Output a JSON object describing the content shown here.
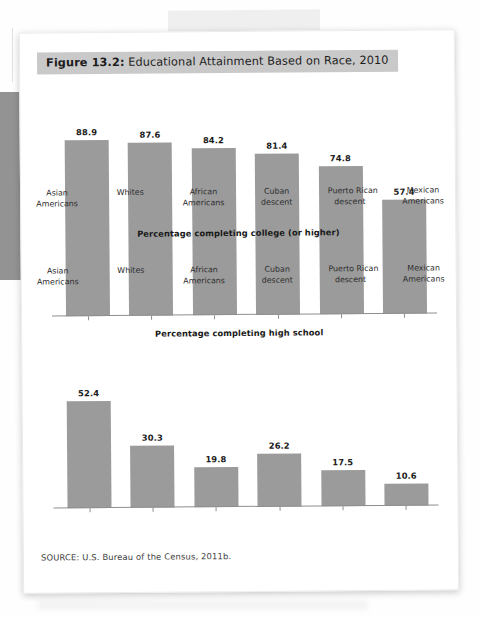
{
  "figure": {
    "number_label": "Figure 13.2:",
    "title_text": " Educational Attainment Based on Race, 2010",
    "source": "SOURCE: U.S. Bureau of the Census, 2011b.",
    "title_highlight_color": "#c9c9c9",
    "bar_color": "#9b9b9b"
  },
  "chart_data": [
    {
      "type": "bar",
      "title": "Percentage completing high school",
      "xlabel": "",
      "ylabel": "",
      "ylim": [
        0,
        100
      ],
      "grid": false,
      "legend": "none",
      "categories": [
        "Asian Americans",
        "Whites",
        "African Americans",
        "Cuban descent",
        "Puerto Rican descent",
        "Mexican Americans"
      ],
      "category_lines": [
        [
          "Asian",
          "Americans"
        ],
        [
          "Whites",
          ""
        ],
        [
          "African",
          "Americans"
        ],
        [
          "Cuban",
          "descent"
        ],
        [
          "Puerto Rican",
          "descent"
        ],
        [
          "Mexican",
          "Americans"
        ]
      ],
      "values": [
        88.9,
        87.6,
        84.2,
        81.4,
        74.8,
        57.4
      ],
      "value_labels": [
        "88.9",
        "87.6",
        "84.2",
        "81.4",
        "74.8",
        "57.4"
      ]
    },
    {
      "type": "bar",
      "title": "Percentage completing college (or higher)",
      "xlabel": "",
      "ylabel": "",
      "ylim": [
        0,
        60
      ],
      "grid": false,
      "legend": "none",
      "categories": [
        "Asian Americans",
        "Whites",
        "African Americans",
        "Cuban descent",
        "Puerto Rican descent",
        "Mexican Americans"
      ],
      "category_lines": [
        [
          "Asian",
          "Americans"
        ],
        [
          "Whites",
          ""
        ],
        [
          "African",
          "Americans"
        ],
        [
          "Cuban",
          "descent"
        ],
        [
          "Puerto Rican",
          "descent"
        ],
        [
          "Mexican",
          "Americans"
        ]
      ],
      "values": [
        52.4,
        30.3,
        19.8,
        26.2,
        17.5,
        10.6
      ],
      "value_labels": [
        "52.4",
        "30.3",
        "19.8",
        "26.2",
        "17.5",
        "10.6"
      ]
    }
  ]
}
